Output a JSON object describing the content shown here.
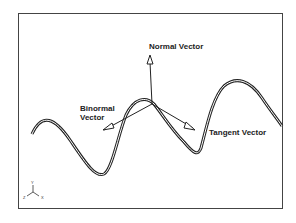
{
  "diagram": {
    "labels": {
      "normal": "Normal Vector",
      "binormal_line1": "Binormal",
      "binormal_line2": "Vector",
      "tangent": "Tangent Vector"
    },
    "axes": {
      "y": "Y",
      "z": "Z",
      "x": "X"
    }
  }
}
